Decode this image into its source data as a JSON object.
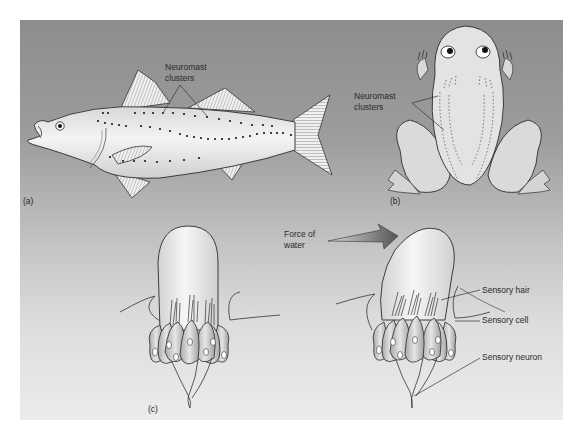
{
  "figure": {
    "panels": {
      "a": {
        "label": "(a)",
        "subject": "fish",
        "callout": "Neuromast\nclusters"
      },
      "b": {
        "label": "(b)",
        "subject": "frog",
        "callout": "Neuromast\nclusters"
      },
      "c": {
        "label": "(c)",
        "subject": "neuromast",
        "arrow_label": "Force of\nwater",
        "callouts": [
          "Sensory hair",
          "Sensory cell",
          "Sensory neuron"
        ]
      }
    },
    "colors": {
      "background_top": "#8d8d8d",
      "background_bottom": "#ececec",
      "body_fill": "#e8e8e8",
      "outline": "#2b2b2b",
      "dots": "#1a1a1a"
    }
  }
}
